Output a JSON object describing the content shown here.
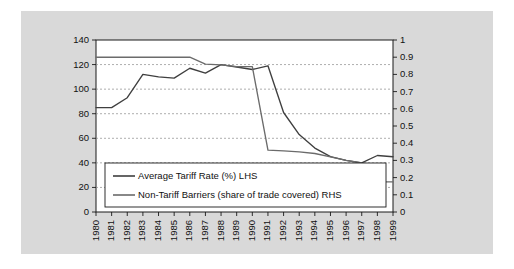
{
  "figure": {
    "panel_bg": "#d9d9d9",
    "plot_bg": "#ffffff",
    "frame_color": "#1a1a1a",
    "grid_color": "#8a8a8a"
  },
  "legend": {
    "entries": [
      {
        "label": "Average Tariff Rate (%) LHS",
        "color": "#3f3f3f"
      },
      {
        "label": "Non-Tariff Barriers (share of trade covered) RHS",
        "color": "#6b6b6b"
      }
    ]
  },
  "chart_data": {
    "type": "line",
    "title": "",
    "subtitle": "",
    "xlabel": "",
    "ylabel": "",
    "y2label": "",
    "grid": true,
    "legend_position": "inside-bottom-left",
    "categories": [
      "1980",
      "1981",
      "1982",
      "1983",
      "1984",
      "1985",
      "1986",
      "1987",
      "1988",
      "1989",
      "1990",
      "1991",
      "1992",
      "1993",
      "1994",
      "1995",
      "1996",
      "1997",
      "1998",
      "1999"
    ],
    "ylim": [
      0,
      140
    ],
    "yticks": [
      0,
      20,
      40,
      60,
      80,
      100,
      120,
      140
    ],
    "ytick_labels": [
      "0",
      "20",
      "40",
      "60",
      "80",
      "100",
      "120",
      "140"
    ],
    "y2lim": [
      0,
      1
    ],
    "y2ticks": [
      0,
      0.1,
      0.2,
      0.3,
      0.4,
      0.5,
      0.6,
      0.7,
      0.8,
      0.9,
      1
    ],
    "y2tick_labels": [
      "0",
      "0.1",
      "0.2",
      "0.3",
      "0.4",
      "0.5",
      "0.6",
      "0.7",
      "0.8",
      "0.9",
      "1"
    ],
    "series": [
      {
        "name": "Average Tariff Rate (%) LHS",
        "axis": "left",
        "color": "#3f3f3f",
        "values": [
          85,
          85,
          93,
          112,
          110,
          109,
          117,
          113,
          120,
          118,
          116,
          119,
          81,
          63,
          52,
          45,
          42,
          40,
          46,
          45
        ]
      },
      {
        "name": "Non-Tariff Barriers (share of trade covered) RHS",
        "axis": "right",
        "color": "#6b6b6b",
        "values": [
          0.9,
          0.9,
          0.9,
          0.9,
          0.9,
          0.9,
          0.9,
          0.86,
          0.855,
          0.845,
          0.845,
          0.36,
          0.355,
          0.35,
          0.34,
          0.32,
          0.3,
          0.285,
          0.175,
          0.175
        ]
      }
    ]
  }
}
